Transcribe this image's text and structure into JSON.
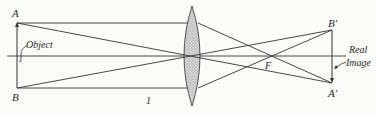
{
  "diagram": {
    "labels": {
      "A": "A",
      "B": "B",
      "A_prime": "A′",
      "B_prime": "B′",
      "F": "F",
      "object": "Object",
      "real": "Real",
      "image": "Image",
      "figure_number": "1"
    },
    "colors": {
      "line": "#333333",
      "lens_fill": "#c9c9c9",
      "background": "#fbfbfa"
    },
    "points": {
      "A": [
        17,
        23
      ],
      "B": [
        17,
        88
      ],
      "A_prime": [
        332,
        83
      ],
      "B_prime": [
        332,
        30
      ],
      "F": [
        268,
        56
      ],
      "lens_center": [
        192,
        56
      ]
    }
  }
}
